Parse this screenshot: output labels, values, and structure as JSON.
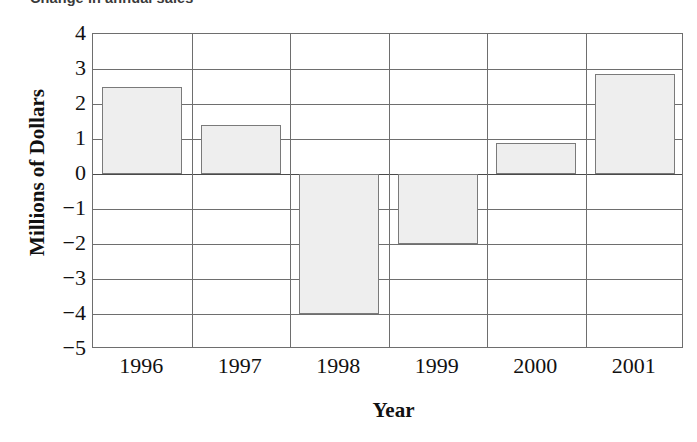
{
  "chart_data": {
    "type": "bar",
    "title": "Change in annual sales",
    "xlabel": "Year",
    "ylabel": "Millions of Dollars",
    "categories": [
      "1996",
      "1997",
      "1998",
      "1999",
      "2000",
      "2001"
    ],
    "values": [
      2.5,
      1.4,
      -4.0,
      -2.0,
      0.9,
      2.85
    ],
    "ylim": [
      -5,
      4
    ],
    "yticks": [
      "4",
      "3",
      "2",
      "1",
      "0",
      "−1",
      "−2",
      "−3",
      "−4",
      "−5"
    ],
    "ytick_values": [
      4,
      3,
      2,
      1,
      0,
      -1,
      -2,
      -3,
      -4,
      -5
    ],
    "grid": true,
    "legend": null,
    "bar_fill": "#eeeeee",
    "bar_border": "#7a7a7a",
    "grid_color": "#6e6e6e"
  },
  "axes": {
    "x_title": "Year",
    "y_title": "Millions of Dollars"
  },
  "title": {
    "text": "Change in annual sales"
  }
}
